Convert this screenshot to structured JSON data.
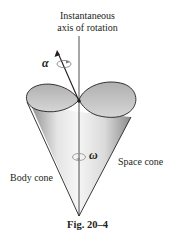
{
  "figure": {
    "axis_label_line1": "Instantaneous",
    "axis_label_line2": "axis of rotation",
    "alpha_symbol": "α",
    "omega_symbol": "ω",
    "body_cone_label": "Body cone",
    "space_cone_label": "Space cone",
    "caption": "Fig. 20–4"
  },
  "colors": {
    "line": "#231f20",
    "cone_fill_light": "#f2f2f2",
    "cone_fill_dark": "#9a9a9a",
    "cone_top": "#c4c4c4"
  }
}
